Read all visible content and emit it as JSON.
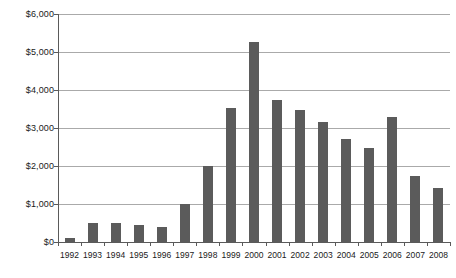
{
  "chart_data": {
    "type": "bar",
    "title": "",
    "subtitle": "",
    "xlabel": "",
    "ylabel": "",
    "categories": [
      "1992",
      "1993",
      "1994",
      "1995",
      "1996",
      "1997",
      "1998",
      "1999",
      "2000",
      "2001",
      "2002",
      "2003",
      "2004",
      "2005",
      "2006",
      "2007",
      "2008"
    ],
    "values": [
      100,
      500,
      500,
      450,
      400,
      1000,
      2000,
      3520,
      5260,
      3750,
      3480,
      3160,
      2700,
      2470,
      3280,
      1740,
      1420
    ],
    "ylim": [
      0,
      6000
    ],
    "y_tick_values": [
      0,
      1000,
      2000,
      3000,
      4000,
      5000,
      6000
    ],
    "y_tick_labels": [
      "$0",
      "$1,000",
      "$2,000",
      "$3,000",
      "$4,000",
      "$5,000",
      "$6,000"
    ],
    "grid": true,
    "legend": "none",
    "series_color": "#5b5b5b",
    "gridline_color": "#aaaaaa",
    "axis_color": "#5a5a5a",
    "background": "#ffffff"
  }
}
